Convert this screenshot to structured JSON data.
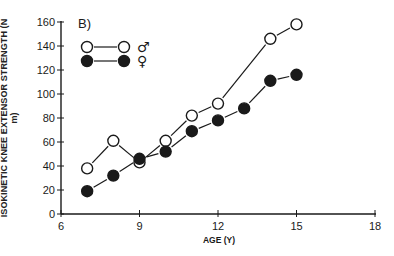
{
  "chart_data": {
    "type": "line",
    "panel_label": "B)",
    "title": "",
    "xlabel": "AGE (Y)",
    "ylabel": "ISOKINETIC KNEE EXTENSOR STRENGTH (N m)",
    "xlim": [
      6,
      18
    ],
    "ylim": [
      0,
      160
    ],
    "xticks": [
      6,
      9,
      12,
      15,
      18
    ],
    "yticks": [
      0,
      20,
      40,
      60,
      80,
      100,
      120,
      140,
      160
    ],
    "grid": false,
    "legend_position": "upper left",
    "x": [
      7,
      8,
      9,
      10,
      11,
      12,
      13,
      14,
      15
    ],
    "series": [
      {
        "name": "Male",
        "symbol": "♂",
        "marker": "open-circle",
        "x": [
          7,
          8,
          9,
          10,
          11,
          12,
          14,
          15
        ],
        "values": [
          38,
          61,
          43,
          61,
          82,
          92,
          146,
          158
        ]
      },
      {
        "name": "Female",
        "symbol": "♀",
        "marker": "filled-circle",
        "x": [
          7,
          8,
          9,
          10,
          11,
          12,
          13,
          14,
          15
        ],
        "values": [
          19,
          32,
          46,
          52,
          69,
          78,
          88,
          111,
          116
        ]
      }
    ]
  },
  "colors": {
    "ink": "#1a1a1a",
    "background": "#ffffff"
  }
}
